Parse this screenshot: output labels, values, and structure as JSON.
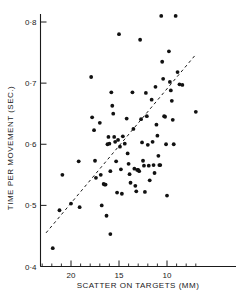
{
  "chart_data": {
    "type": "scatter",
    "title": "",
    "xlabel": "SCATTER ON TARGETS  (MM)",
    "ylabel": "TIME PER MOVEMENT (SEC.)",
    "xlim": [
      23.0,
      6.5
    ],
    "ylim": [
      0.4,
      0.83
    ],
    "x_axis_reversed": true,
    "grid": false,
    "legend": null,
    "xticks_major": [
      20,
      15,
      10
    ],
    "xtick_labels": [
      "20",
      "15",
      "10"
    ],
    "xticks_minor": [
      23,
      22,
      21,
      19,
      18,
      17,
      16,
      14,
      13,
      12,
      11,
      9,
      8,
      7
    ],
    "yticks_major": [
      0.8,
      0.7,
      0.6,
      0.5,
      0.4
    ],
    "ytick_labels": [
      "0·8",
      "0·7",
      "0·6",
      "0·5",
      "0·4"
    ],
    "annotations": [
      {
        "name": "regression-line",
        "type": "dashed-line",
        "x_start": 22.6,
        "y_start": 0.455,
        "x_end": 7.1,
        "y_end": 0.745
      }
    ],
    "series": [
      {
        "name": "observations",
        "marker": "filled-circle",
        "marker_size_px": 3.0,
        "color": "#111111",
        "points": [
          [
            21.9,
            0.43
          ],
          [
            21.2,
            0.492
          ],
          [
            20.9,
            0.55
          ],
          [
            20.0,
            0.503
          ],
          [
            19.2,
            0.572
          ],
          [
            19.1,
            0.497
          ],
          [
            17.9,
            0.71
          ],
          [
            17.8,
            0.644
          ],
          [
            17.6,
            0.623
          ],
          [
            17.5,
            0.573
          ],
          [
            17.4,
            0.545
          ],
          [
            17.0,
            0.635
          ],
          [
            16.9,
            0.55
          ],
          [
            16.8,
            0.5
          ],
          [
            16.6,
            0.535
          ],
          [
            16.5,
            0.534
          ],
          [
            16.4,
            0.534
          ],
          [
            16.3,
            0.483
          ],
          [
            16.2,
            0.6
          ],
          [
            16.1,
            0.612
          ],
          [
            16.0,
            0.601
          ],
          [
            15.9,
            0.556
          ],
          [
            15.9,
            0.453
          ],
          [
            15.8,
            0.685
          ],
          [
            15.7,
            0.663
          ],
          [
            15.6,
            0.65
          ],
          [
            15.5,
            0.612
          ],
          [
            15.4,
            0.604
          ],
          [
            15.3,
            0.572
          ],
          [
            15.2,
            0.521
          ],
          [
            15.1,
            0.607
          ],
          [
            15.0,
            0.78
          ],
          [
            14.9,
            0.596
          ],
          [
            14.8,
            0.559
          ],
          [
            14.7,
            0.519
          ],
          [
            14.6,
            0.613
          ],
          [
            14.4,
            0.601
          ],
          [
            14.2,
            0.642
          ],
          [
            14.1,
            0.585
          ],
          [
            14.0,
            0.568
          ],
          [
            13.9,
            0.551
          ],
          [
            13.8,
            0.537
          ],
          [
            13.6,
            0.685
          ],
          [
            13.5,
            0.625
          ],
          [
            13.4,
            0.56
          ],
          [
            13.3,
            0.532
          ],
          [
            13.2,
            0.523
          ],
          [
            13.1,
            0.558
          ],
          [
            13.0,
            0.558
          ],
          [
            12.9,
            0.556
          ],
          [
            12.8,
            0.771
          ],
          [
            12.7,
            0.641
          ],
          [
            12.6,
            0.603
          ],
          [
            12.5,
            0.573
          ],
          [
            12.4,
            0.565
          ],
          [
            12.3,
            0.522
          ],
          [
            12.2,
            0.684
          ],
          [
            12.1,
            0.646
          ],
          [
            12.0,
            0.599
          ],
          [
            11.9,
            0.565
          ],
          [
            11.8,
            0.541
          ],
          [
            11.6,
            0.673
          ],
          [
            11.5,
            0.604
          ],
          [
            11.4,
            0.566
          ],
          [
            11.3,
            0.553
          ],
          [
            11.2,
            0.694
          ],
          [
            11.1,
            0.632
          ],
          [
            11.0,
            0.614
          ],
          [
            10.9,
            0.581
          ],
          [
            10.8,
            0.566
          ],
          [
            10.7,
            0.566
          ],
          [
            10.6,
            0.81
          ],
          [
            10.5,
            0.735
          ],
          [
            10.4,
            0.707
          ],
          [
            10.3,
            0.646
          ],
          [
            10.2,
            0.645
          ],
          [
            10.1,
            0.6
          ],
          [
            10.0,
            0.516
          ],
          [
            9.8,
            0.752
          ],
          [
            9.7,
            0.702
          ],
          [
            9.6,
            0.688
          ],
          [
            9.5,
            0.671
          ],
          [
            9.4,
            0.64
          ],
          [
            9.3,
            0.6
          ],
          [
            9.1,
            0.81
          ],
          [
            8.9,
            0.718
          ],
          [
            8.7,
            0.698
          ],
          [
            8.4,
            0.697
          ],
          [
            7.0,
            0.653
          ]
        ]
      }
    ]
  },
  "axes": {
    "y_title": "TIME PER MOVEMENT (SEC.)",
    "x_title": "SCATTER ON TARGETS  (MM)"
  }
}
